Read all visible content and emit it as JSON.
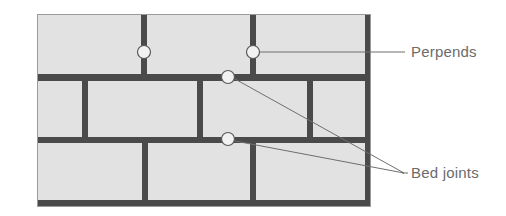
{
  "figure": {
    "background_color": "#ffffff"
  },
  "wall": {
    "x": 37,
    "y": 14,
    "width": 334,
    "height": 193,
    "brick_fill": "#e2e2e2",
    "mortar_color": "#4a4a4a",
    "outline_color": "#9a9a9a",
    "rows": [
      {
        "name": "row-1",
        "y": 14,
        "height": 60,
        "perpend_x": [
          144,
          253
        ]
      },
      {
        "name": "row-2",
        "y": 81,
        "height": 56,
        "perpend_x": [
          85,
          200,
          310
        ]
      },
      {
        "name": "row-3",
        "y": 143,
        "height": 57,
        "perpend_x": [
          145,
          253
        ]
      }
    ],
    "bed_joints": [
      {
        "name": "bed-joint-1",
        "y": 74,
        "height": 7
      },
      {
        "name": "bed-joint-2",
        "y": 137,
        "height": 6
      },
      {
        "name": "bed-joint-3",
        "y": 200,
        "height": 7
      }
    ],
    "perpend_width": 6
  },
  "markers": [
    {
      "name": "marker-perpend-1",
      "cx": 144,
      "cy": 52,
      "r": 7,
      "refers_to": "Perpends"
    },
    {
      "name": "marker-perpend-2",
      "cx": 253,
      "cy": 52,
      "r": 7,
      "refers_to": "Perpends"
    },
    {
      "name": "marker-bed-joint-1",
      "cx": 228,
      "cy": 77,
      "r": 7,
      "refers_to": "Bed joints"
    },
    {
      "name": "marker-bed-joint-2",
      "cx": 228,
      "cy": 139,
      "r": 7,
      "refers_to": "Bed joints"
    }
  ],
  "leader_lines": [
    {
      "name": "leader-perpends",
      "x1": 260,
      "y1": 52,
      "x2": 405,
      "y2": 52
    },
    {
      "name": "leader-bed-joint-1",
      "x1": 235,
      "y1": 79,
      "x2": 402,
      "y2": 173
    },
    {
      "name": "leader-bed-joint-2",
      "x1": 235,
      "y1": 140,
      "x2": 402,
      "y2": 173
    },
    {
      "name": "leader-bed-joints-stem",
      "x1": 402,
      "y1": 173,
      "x2": 407,
      "y2": 173
    }
  ],
  "labels": {
    "perpends": "Perpends",
    "bed_joints": "Bed joints",
    "color": "#6b6b6b"
  }
}
